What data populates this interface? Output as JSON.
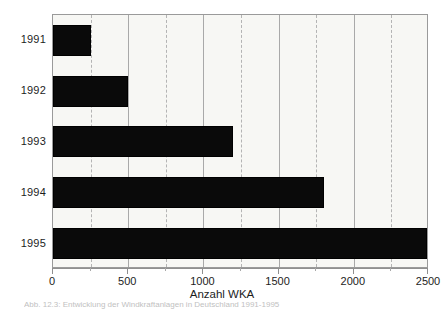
{
  "chart_data": {
    "type": "bar",
    "orientation": "horizontal",
    "title": "",
    "xlabel": "Anzahl WKA",
    "ylabel": "",
    "categories": [
      "1991",
      "1992",
      "1993",
      "1994",
      "1995"
    ],
    "values": [
      250,
      500,
      1200,
      1800,
      2500
    ],
    "series": [
      {
        "name": "Anzahl WKA",
        "values": [
          250,
          500,
          1200,
          1800,
          2500
        ]
      }
    ],
    "xlim": [
      0,
      2500
    ],
    "xticks": [
      0,
      500,
      1000,
      1500,
      2000,
      2500
    ],
    "xtick_labels": [
      "0",
      "500",
      "1000",
      "1500",
      "2000",
      "2500"
    ],
    "minor_xticks": [
      250,
      750,
      1250,
      1750,
      2250
    ],
    "grid": "major solid, minor dashed, vertical only",
    "legend": "none",
    "bar_color": "#0a0a0a",
    "plot_background": "#f7f7f4",
    "frame_color": "#9a9a9a"
  },
  "caption": {
    "text": "Abb. 12.3: Entwicklung der Windkraftanlagen in Deutschland 1991-1995",
    "note": "cut off at bottom edge of image"
  }
}
